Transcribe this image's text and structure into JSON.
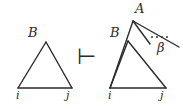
{
  "figure": {
    "kind": "derivation-diagram",
    "background_color": "#ffffff",
    "ink_color": "#2b2b2b",
    "stroke_width": 1.4,
    "left_structure": {
      "name": "source-tree",
      "apex_label": "B",
      "left_leaf_label": "i",
      "right_leaf_label": "j"
    },
    "operator": {
      "name": "turnstile",
      "glyph": "⊢"
    },
    "right_structure": {
      "name": "derived-tree",
      "root_label": "A",
      "inner_apex_label": "B",
      "left_leaf_label": "i",
      "right_leaf_label": "j",
      "ellipsis": "· · ·",
      "branch_label": "β"
    }
  },
  "geometry": {
    "left_triangle": {
      "apex": [
        46,
        42
      ],
      "base_left": [
        18,
        88
      ],
      "base_right": [
        72,
        88
      ]
    },
    "turnstile_pos": [
      78,
      47
    ],
    "right_root": [
      133,
      21
    ],
    "right_spine_end": [
      116,
      88
    ],
    "right_inner_apex": [
      128,
      41
    ],
    "right_base_left": [
      110,
      88
    ],
    "right_base_right": [
      166,
      88
    ],
    "fan_mid_end": [
      152,
      45
    ],
    "fan_outer_end": [
      178,
      47
    ],
    "ellipsis_pos": [
      152,
      36
    ]
  },
  "labels": {
    "left_apex": {
      "text": "B",
      "x": 28,
      "y": 26
    },
    "left_leaf_i": {
      "text": "i",
      "x": 16,
      "y": 90
    },
    "left_leaf_j": {
      "text": "j",
      "x": 66,
      "y": 90
    },
    "operator": {
      "text": "⊢",
      "x": 77,
      "y": 46
    },
    "right_root_A": {
      "text": "A",
      "x": 135,
      "y": 2
    },
    "right_inner_B": {
      "text": "B",
      "x": 110,
      "y": 26
    },
    "right_leaf_i": {
      "text": "i",
      "x": 108,
      "y": 90
    },
    "right_leaf_j": {
      "text": "j",
      "x": 160,
      "y": 90
    },
    "beta": {
      "text": "β",
      "x": 157,
      "y": 41
    }
  }
}
